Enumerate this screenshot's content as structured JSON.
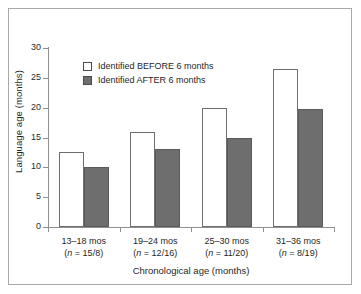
{
  "chart_data": {
    "type": "bar",
    "title": "",
    "xlabel": "Chronological age (months)",
    "ylabel": "Language age (months)",
    "ylim": [
      0,
      30
    ],
    "yticks": [
      0,
      5,
      10,
      15,
      20,
      25,
      30
    ],
    "grid": false,
    "legend_position": "upper-left-inside",
    "categories": [
      "13–18 mos",
      "19–24 mos",
      "25–30 mos",
      "31–36 mos"
    ],
    "category_sublabels": [
      "(n = 15/8)",
      "(n = 12/16)",
      "(n = 11/20)",
      "(n = 8/19)"
    ],
    "series": [
      {
        "name": "Identified BEFORE 6 months",
        "color": "#ffffff",
        "edge_color": "#6e6e6e",
        "values": [
          12.6,
          16.0,
          19.9,
          26.5
        ]
      },
      {
        "name": "Identified AFTER 6 months",
        "color": "#6e6e6e",
        "edge_color": "#5a5a5a",
        "values": [
          10.0,
          13.1,
          14.9,
          19.8
        ]
      }
    ]
  },
  "legend": {
    "items": [
      {
        "label": "Identified BEFORE 6 months"
      },
      {
        "label": "Identified AFTER 6 months"
      }
    ]
  },
  "axes": {
    "y_tick_labels": [
      "30",
      "25",
      "20",
      "15",
      "10",
      "5",
      "0"
    ],
    "y_title": "Language age (months)",
    "x_title": "Chronological age (months)"
  },
  "groups": [
    {
      "label": "13–18 mos",
      "n_prefix": "(",
      "n_italic": "n",
      "n_rest": " = 15/8)"
    },
    {
      "label": "19–24 mos",
      "n_prefix": "(",
      "n_italic": "n",
      "n_rest": " = 12/16)"
    },
    {
      "label": "25–30 mos",
      "n_prefix": "(",
      "n_italic": "n",
      "n_rest": " = 11/20)"
    },
    {
      "label": "31–36 mos",
      "n_prefix": "(",
      "n_italic": "n",
      "n_rest": " = 8/19)"
    }
  ],
  "colors": {
    "bar_after_fill": "#6e6e6e",
    "bar_before_fill": "#ffffff",
    "axis": "#8f8f8f",
    "frame": "#a8a8a8",
    "text": "#1f1f1f"
  }
}
